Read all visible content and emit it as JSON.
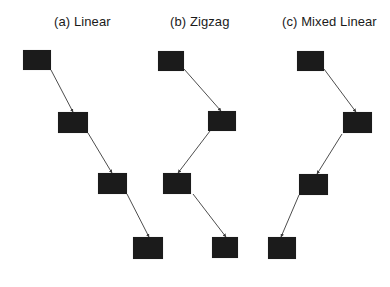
{
  "colors": {
    "background": "#ffffff",
    "node_fill": "#1b1b1b",
    "edge": "#3a3a3a",
    "text": "#1a1a1a"
  },
  "panels": [
    {
      "id": "a",
      "title": "(a) Linear",
      "title_x": 54,
      "nodes": [
        {
          "x": 23,
          "y": 50,
          "w": 28,
          "h": 20
        },
        {
          "x": 58,
          "y": 112,
          "w": 30,
          "h": 21
        },
        {
          "x": 98,
          "y": 173,
          "w": 29,
          "h": 21
        },
        {
          "x": 133,
          "y": 237,
          "w": 30,
          "h": 22
        }
      ],
      "edges": [
        {
          "x1": 51,
          "y1": 70,
          "x2": 73,
          "y2": 112
        },
        {
          "x1": 88,
          "y1": 133,
          "x2": 112,
          "y2": 173
        },
        {
          "x1": 127,
          "y1": 194,
          "x2": 149,
          "y2": 237
        }
      ]
    },
    {
      "id": "b",
      "title": "(b) Zigzag",
      "title_x": 170,
      "nodes": [
        {
          "x": 158,
          "y": 51,
          "w": 26,
          "h": 20
        },
        {
          "x": 208,
          "y": 111,
          "w": 28,
          "h": 20
        },
        {
          "x": 163,
          "y": 173,
          "w": 28,
          "h": 21
        },
        {
          "x": 212,
          "y": 237,
          "w": 26,
          "h": 21
        }
      ],
      "edges": [
        {
          "x1": 184,
          "y1": 69,
          "x2": 221,
          "y2": 111
        },
        {
          "x1": 210,
          "y1": 131,
          "x2": 178,
          "y2": 173
        },
        {
          "x1": 193,
          "y1": 194,
          "x2": 226,
          "y2": 237
        }
      ]
    },
    {
      "id": "c",
      "title": "(c) Mixed Linear",
      "title_x": 282,
      "nodes": [
        {
          "x": 297,
          "y": 51,
          "w": 27,
          "h": 20
        },
        {
          "x": 343,
          "y": 112,
          "w": 29,
          "h": 21
        },
        {
          "x": 299,
          "y": 174,
          "w": 29,
          "h": 21
        },
        {
          "x": 268,
          "y": 237,
          "w": 28,
          "h": 22
        }
      ],
      "edges": [
        {
          "x1": 324,
          "y1": 69,
          "x2": 356,
          "y2": 112
        },
        {
          "x1": 342,
          "y1": 134,
          "x2": 317,
          "y2": 174
        },
        {
          "x1": 299,
          "y1": 195,
          "x2": 281,
          "y2": 237
        }
      ]
    }
  ]
}
